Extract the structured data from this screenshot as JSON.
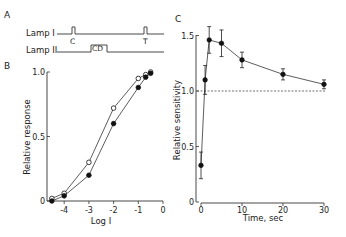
{
  "panel_a": {
    "label": "A",
    "lamp1_label": "Lamp I",
    "lamp2_label": "Lamp II",
    "pulse_c": "C",
    "pulse_t": "T",
    "box_cd": "CD"
  },
  "panel_b": {
    "label": "B",
    "ylabel": "Relative response",
    "xlabel": "Log I",
    "yticks": [
      "0",
      "0.5",
      "1.0"
    ],
    "xticks": [
      "-4",
      "-3",
      "-2",
      "-1",
      "0"
    ]
  },
  "panel_c": {
    "label": "C",
    "ylabel": "Relative sensitivity",
    "xlabel": "Time, sec",
    "yticks": [
      "0",
      "0.5",
      "1.0",
      "1.5"
    ],
    "xticks": [
      "0",
      "10",
      "20",
      "30"
    ]
  },
  "chart_data": [
    {
      "type": "line",
      "title": "B",
      "xlabel": "Log I",
      "ylabel": "Relative response",
      "xlim": [
        -4.6,
        0
      ],
      "ylim": [
        0,
        1.0
      ],
      "series": [
        {
          "name": "open circles",
          "marker": "open-circle",
          "x": [
            -4.5,
            -4,
            -3,
            -2,
            -1,
            -0.7,
            -0.5
          ],
          "values": [
            0.02,
            0.06,
            0.3,
            0.72,
            0.95,
            0.98,
            1.0
          ]
        },
        {
          "name": "filled circles",
          "marker": "filled-circle",
          "x": [
            -4.5,
            -4,
            -3,
            -2,
            -1,
            -0.7,
            -0.5
          ],
          "values": [
            0.0,
            0.04,
            0.2,
            0.6,
            0.88,
            0.96,
            0.99
          ]
        }
      ]
    },
    {
      "type": "line",
      "title": "C",
      "xlabel": "Time, sec",
      "ylabel": "Relative sensitivity",
      "xlim": [
        0,
        30
      ],
      "ylim": [
        0,
        1.5
      ],
      "reference_line": 1.0,
      "series": [
        {
          "name": "sensitivity",
          "marker": "filled-circle",
          "x": [
            0,
            1,
            2,
            5,
            10,
            20,
            30
          ],
          "values": [
            0.33,
            1.1,
            1.46,
            1.43,
            1.28,
            1.15,
            1.06
          ],
          "errors": [
            0.12,
            0.13,
            0.12,
            0.12,
            0.07,
            0.05,
            0.04
          ]
        }
      ]
    }
  ]
}
